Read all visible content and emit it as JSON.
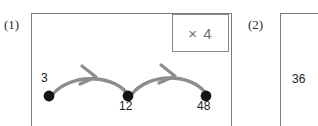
{
  "heading": "Answers:",
  "items": [
    {
      "label": "(1)",
      "rule": "× 4",
      "nodes": [
        {
          "value": "3",
          "x": 49,
          "y": 96
        },
        {
          "value": "12",
          "x": 128,
          "y": 96
        },
        {
          "value": "48",
          "x": 206,
          "y": 96
        }
      ]
    },
    {
      "label": "(2)",
      "rule": "",
      "nodes": [
        {
          "value": "36",
          "x": 307,
          "y": 96
        }
      ]
    }
  ],
  "colors": {
    "ink": "#1c1c1c",
    "box_border": "#7b7b7b",
    "rule_border": "#8a8a8a",
    "rule_text": "#6f6f6f",
    "arrow": "#8d8d8d",
    "node_dot": "#141414",
    "page_background": "#ffffff"
  },
  "icons": {
    "arrow": "curved-arrow-icon",
    "node": "filled-dot-icon"
  }
}
